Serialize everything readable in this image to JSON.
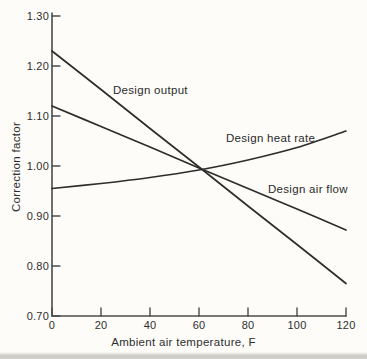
{
  "chart_data": {
    "type": "line",
    "title": "",
    "xlabel": "Ambient air temperature, F",
    "ylabel": "Correction factor",
    "xlim": [
      0,
      120
    ],
    "ylim": [
      0.7,
      1.3
    ],
    "x_ticks": [
      0,
      20,
      40,
      60,
      80,
      100,
      120
    ],
    "y_ticks": [
      0.7,
      0.8,
      0.9,
      1.0,
      1.1,
      1.2,
      1.3
    ],
    "grid": false,
    "legend_position": "inline-labels",
    "x": [
      0,
      20,
      40,
      60,
      80,
      100,
      120
    ],
    "series": [
      {
        "name": "Design output",
        "values": [
          1.23,
          1.153,
          1.075,
          0.998,
          0.92,
          0.843,
          0.765
        ]
      },
      {
        "name": "Design heat rate",
        "values": [
          0.955,
          0.965,
          0.977,
          0.992,
          1.012,
          1.037,
          1.07
        ]
      },
      {
        "name": "Design air flow",
        "values": [
          1.12,
          1.079,
          1.038,
          0.996,
          0.955,
          0.914,
          0.872
        ]
      }
    ],
    "line_color": "#2d2d2d",
    "axis_color": "#4c4c4c",
    "background": "#fdfcf9"
  }
}
